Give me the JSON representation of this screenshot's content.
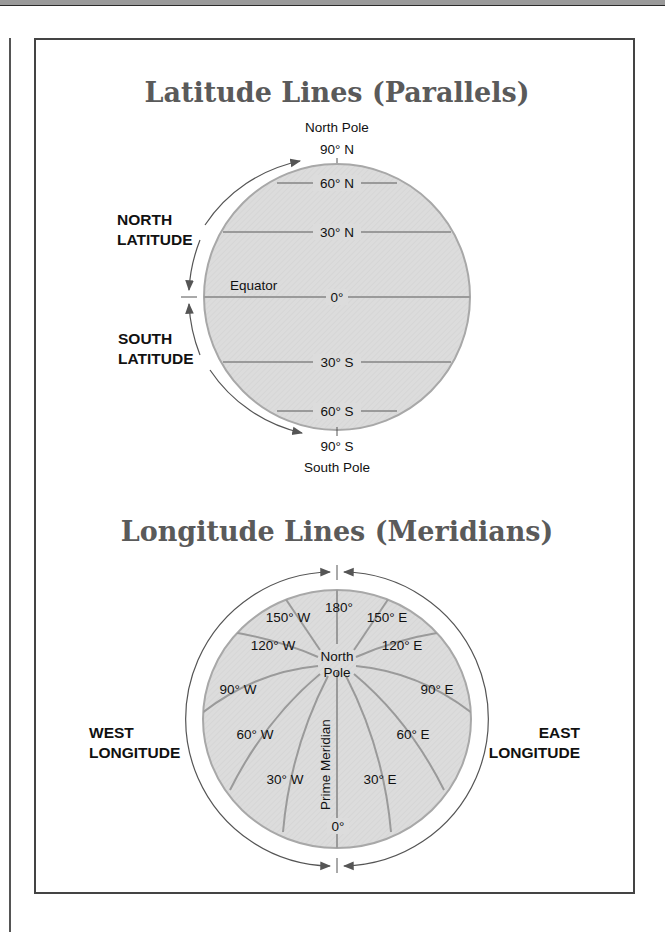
{
  "colors": {
    "globe_fill": "#dcdcdc",
    "globe_edge": "#a8a8a8",
    "grid_line": "#9a9a9a",
    "title_text": "#5a5a5a",
    "label_text": "#111111",
    "arrow": "#555555"
  },
  "latitude": {
    "title": "Latitude Lines (Parallels)",
    "north_pole": "North Pole",
    "top_label": "90° N",
    "bottom_label": "90° S",
    "south_pole": "South Pole",
    "north_group": [
      "NORTH",
      "LATITUDE"
    ],
    "south_group": [
      "SOUTH",
      "LATITUDE"
    ],
    "equator_name": "Equator",
    "lines": [
      {
        "label": "60° N"
      },
      {
        "label": "30° N"
      },
      {
        "label": "0°"
      },
      {
        "label": "30° S"
      },
      {
        "label": "60° S"
      }
    ]
  },
  "longitude": {
    "title": "Longitude Lines (Meridians)",
    "center_label": [
      "North",
      "Pole"
    ],
    "prime_meridian": "Prime Meridian",
    "west_group": [
      "WEST",
      "LONGITUDE"
    ],
    "east_group": [
      "EAST",
      "LONGITUDE"
    ],
    "meridians": [
      {
        "label": "180°"
      },
      {
        "label": "150° W"
      },
      {
        "label": "150° E"
      },
      {
        "label": "120° W"
      },
      {
        "label": "120° E"
      },
      {
        "label": "90° W"
      },
      {
        "label": "90° E"
      },
      {
        "label": "60° W"
      },
      {
        "label": "60° E"
      },
      {
        "label": "30° W"
      },
      {
        "label": "30° E"
      },
      {
        "label": "0°"
      }
    ]
  }
}
